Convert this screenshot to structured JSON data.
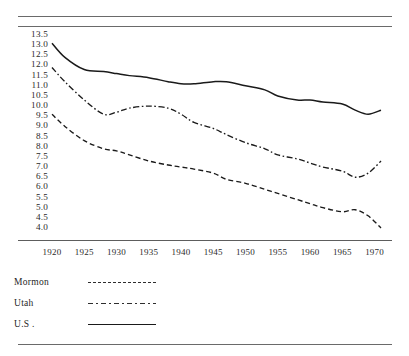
{
  "chart_data": {
    "type": "line",
    "title": "",
    "subtitle": "",
    "xlabel": "",
    "ylabel": "",
    "xlim": [
      1918,
      1972
    ],
    "ylim": [
      4.0,
      13.5
    ],
    "grid": false,
    "legend_position": "below-left",
    "xticks": [
      1920,
      1925,
      1930,
      1935,
      1940,
      1945,
      1950,
      1955,
      1960,
      1965,
      1970
    ],
    "yticks": [
      13.5,
      13.0,
      12.5,
      12.0,
      11.5,
      11.0,
      10.5,
      10.0,
      9.5,
      9.0,
      8.5,
      8.0,
      7.5,
      7.0,
      6.5,
      6.0,
      5.5,
      5.0,
      4.5,
      4.0
    ],
    "x": [
      1920,
      1922,
      1925,
      1928,
      1930,
      1932,
      1935,
      1938,
      1940,
      1942,
      1945,
      1947,
      1950,
      1953,
      1955,
      1958,
      1960,
      1962,
      1965,
      1967,
      1969,
      1971
    ],
    "series": [
      {
        "name": "Mormon",
        "style": "dashed",
        "values": [
          9.6,
          9.0,
          8.3,
          7.9,
          7.8,
          7.6,
          7.3,
          7.1,
          7.0,
          6.9,
          6.7,
          6.4,
          6.2,
          5.9,
          5.7,
          5.4,
          5.2,
          5.0,
          4.8,
          4.9,
          4.6,
          4.0
        ]
      },
      {
        "name": "Utah",
        "style": "dash-dot",
        "values": [
          11.9,
          11.2,
          10.3,
          9.6,
          9.7,
          9.9,
          10.0,
          9.9,
          9.6,
          9.2,
          8.9,
          8.6,
          8.2,
          7.9,
          7.6,
          7.4,
          7.2,
          7.0,
          6.8,
          6.5,
          6.7,
          7.3
        ]
      },
      {
        "name": "U.S.",
        "style": "solid",
        "values": [
          13.1,
          12.4,
          11.8,
          11.7,
          11.6,
          11.5,
          11.4,
          11.2,
          11.1,
          11.1,
          11.2,
          11.2,
          11.0,
          10.8,
          10.5,
          10.3,
          10.3,
          10.2,
          10.1,
          9.8,
          9.6,
          9.8
        ]
      }
    ]
  },
  "axes": {
    "ytick_labels": [
      "13.5",
      "13.0",
      "12.5",
      "12.0",
      "11.5",
      "11.0",
      "10.5",
      "10.0",
      "9.5",
      "9.0",
      "8.5",
      "8.0",
      "7.5",
      "7.0",
      "6.5",
      "6.0",
      "5.5",
      "5.0",
      "4.5",
      "4.0"
    ],
    "xtick_labels": [
      "1920",
      "1925",
      "1930",
      "1935",
      "1940",
      "1945",
      "1950",
      "1955",
      "1960",
      "1965",
      "1970"
    ]
  },
  "legend": {
    "items": [
      {
        "label": "Mormon",
        "style": "dashed"
      },
      {
        "label": "Utah",
        "style": "dash-dot"
      },
      {
        "label": "U.S .",
        "style": "solid"
      }
    ]
  },
  "colors": {
    "ink": "#1a1a1a",
    "rule": "#6a6a6a",
    "background": "#ffffff"
  }
}
